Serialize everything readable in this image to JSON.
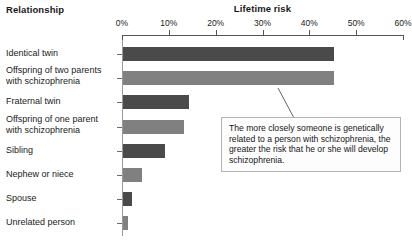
{
  "headers": {
    "relationship": "Relationship",
    "lifetime_risk": "Lifetime risk"
  },
  "callout": {
    "text": "The more closely someone is genetically related to a person with schizophrenia, the greater the risk that he or she will develop schizophrenia."
  },
  "chart_data": {
    "type": "bar",
    "orientation": "horizontal",
    "title": "Lifetime risk",
    "xlabel": "Lifetime risk",
    "ylabel": "Relationship",
    "xlim": [
      0,
      60
    ],
    "xticks": [
      0,
      10,
      20,
      30,
      40,
      50,
      60
    ],
    "xtick_labels": [
      "0%",
      "10%",
      "20%",
      "30%",
      "40%",
      "50%",
      "60%"
    ],
    "grid": false,
    "legend": false,
    "units": "percent",
    "categories": [
      "Identical twin",
      "Offspring of two parents\nwith schizophrenia",
      "Fraternal twin",
      "Offspring of one parent\nwith schizophrenia",
      "Sibling",
      "Nephew or niece",
      "Spouse",
      "Unrelated person"
    ],
    "values": [
      45,
      45,
      14,
      13,
      9,
      4,
      2,
      1
    ],
    "bar_colors": [
      "#4a4a4a",
      "#808080",
      "#4a4a4a",
      "#808080",
      "#4a4a4a",
      "#808080",
      "#4a4a4a",
      "#808080"
    ],
    "annotations": [
      {
        "text": "The more closely someone is genetically related to a person with schizophrenia, the greater the risk that he or she will develop schizophrenia.",
        "points_to": "Offspring of two parents with schizophrenia"
      }
    ]
  },
  "colors": {
    "bar_dark": "#4a4a4a",
    "bar_light": "#808080",
    "axis": "#555555",
    "callout_border": "#b4b4b4",
    "background": "#ffffff"
  }
}
